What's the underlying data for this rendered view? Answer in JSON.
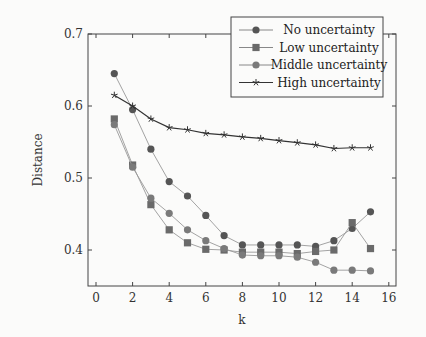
{
  "chart_data": {
    "type": "line",
    "title": "",
    "xlabel": "k",
    "ylabel": "Distance",
    "xlim": [
      -0.5,
      16.5
    ],
    "ylim": [
      0.35,
      0.7
    ],
    "xticks": [
      "0",
      "2",
      "4",
      "6",
      "8",
      "10",
      "12",
      "14",
      "16"
    ],
    "yticks": [
      "0.4",
      "0.5",
      "0.6",
      "0.7"
    ],
    "grid": false,
    "legend_position": "upper right",
    "x": [
      1,
      2,
      3,
      4,
      5,
      6,
      7,
      8,
      9,
      10,
      11,
      12,
      13,
      14,
      15
    ],
    "series": [
      {
        "name": "No uncertainty",
        "marker": "circle",
        "color": "#555555",
        "values": [
          0.645,
          0.595,
          0.54,
          0.495,
          0.475,
          0.448,
          0.42,
          0.407,
          0.407,
          0.407,
          0.407,
          0.405,
          0.413,
          0.43,
          0.453
        ]
      },
      {
        "name": "Low uncertainty",
        "marker": "square",
        "color": "#6a6a6a",
        "values": [
          0.582,
          0.518,
          0.463,
          0.428,
          0.41,
          0.401,
          0.4,
          0.397,
          0.397,
          0.397,
          0.395,
          0.398,
          0.4,
          0.438,
          0.402
        ]
      },
      {
        "name": "Middle uncertainty",
        "marker": "circle",
        "color": "#7a7a7a",
        "values": [
          0.574,
          0.515,
          0.472,
          0.451,
          0.428,
          0.413,
          0.402,
          0.393,
          0.392,
          0.392,
          0.39,
          0.383,
          0.372,
          0.372,
          0.371
        ]
      },
      {
        "name": "High uncertainty",
        "marker": "star",
        "color": "#333333",
        "values": [
          0.615,
          0.6,
          0.582,
          0.57,
          0.567,
          0.562,
          0.56,
          0.557,
          0.555,
          0.552,
          0.549,
          0.546,
          0.541,
          0.542,
          0.542
        ]
      }
    ]
  }
}
